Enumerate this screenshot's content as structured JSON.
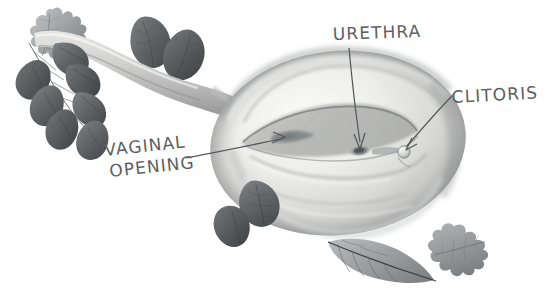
{
  "figure": {
    "kind": "anatomical-botanical-illustration",
    "medium": "graphite-pencil-grayscale",
    "background_color": "#ffffff",
    "width": 553,
    "height": 303
  },
  "palette": {
    "background": "#ffffff",
    "body_light": "#f2f2f1",
    "body_mid": "#cdcdcb",
    "body_shadow": "#9fa0a0",
    "body_deep_shadow": "#7c7d7d",
    "leaf_dark": "#636769",
    "leaf_darkest": "#4b4f52",
    "leaf_mid": "#8d9093",
    "leaf_light": "#b3b6b8",
    "ink": "#4a4d50",
    "label_text": "#5b5f63"
  },
  "labels": [
    {
      "id": "urethra",
      "text": "URETHRA",
      "x": 333,
      "y": 40,
      "anchor": "start",
      "rotation": -2,
      "lines": [
        "URETHRA"
      ]
    },
    {
      "id": "clitoris",
      "text": "CLITORIS",
      "x": 452,
      "y": 103,
      "anchor": "start",
      "rotation": -3,
      "lines": [
        "CLITORIS"
      ]
    },
    {
      "id": "vaginal-opening",
      "text": "VAGINAL OPENING",
      "x": 105,
      "y": 156,
      "anchor": "start",
      "rotation": -6,
      "lines": [
        "VAGINAL",
        "OPENING"
      ]
    }
  ],
  "annotations": {
    "urethra_arrow": {
      "from": [
        349,
        48
      ],
      "to": [
        361,
        150
      ],
      "points_to": "urethral-opening"
    },
    "clitoris_arrow": {
      "from": [
        452,
        96
      ],
      "to": [
        406,
        148
      ],
      "points_to": "clitoral-glans"
    },
    "vaginal_opening_arrow": {
      "from": [
        186,
        158
      ],
      "to": [
        283,
        139
      ],
      "points_to": "vaginal-opening"
    }
  },
  "anatomy_parts": [
    {
      "id": "vulva-body",
      "name": "vulva oval body"
    },
    {
      "id": "stem-handle",
      "name": "tapering stem"
    },
    {
      "id": "labial-fold-outer",
      "name": "outer labial fold"
    },
    {
      "id": "labial-fold-inner",
      "name": "inner labial fold"
    },
    {
      "id": "urethral-opening",
      "name": "urethral opening"
    },
    {
      "id": "clitoral-glans",
      "name": "clitoral glans"
    },
    {
      "id": "vaginal-opening",
      "name": "vaginal opening"
    }
  ],
  "foliage": [
    {
      "id": "oak-leaf-top-left",
      "type": "oak-leaf",
      "position": "top-left"
    },
    {
      "id": "dark-leaf-pair-upper",
      "type": "teardrop-leaf-pair",
      "position": "upper-left"
    },
    {
      "id": "compound-leaflets-left",
      "type": "compound-leaflet-spray",
      "position": "left",
      "leaflet_count": 7
    },
    {
      "id": "dark-leaf-pair-lower",
      "type": "teardrop-leaf-pair",
      "position": "lower-center"
    },
    {
      "id": "willow-leaf-bottom",
      "type": "elongated-veined-leaf",
      "position": "bottom-center-right"
    },
    {
      "id": "oak-leaf-bottom-right",
      "type": "oak-leaf",
      "position": "bottom-right"
    }
  ]
}
